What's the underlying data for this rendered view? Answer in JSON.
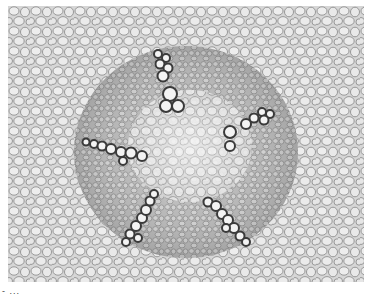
{
  "image": {
    "subject": "plant root cross-section micrograph",
    "description": "Grayscale light micrograph showing parenchyma cells surrounding a central stele with five radiating xylem arms",
    "colors": {
      "background": "#d8d8d8",
      "cell_fill": "#e6e6e6",
      "cell_wall": "#8a8a8a",
      "stele_shade": "#a8a8a8",
      "xylem_wall": "#2a2a2a",
      "xylem_fill": "#f2f2f2"
    },
    "xylem_arms": 5
  },
  "caption": {
    "text": "- ..."
  }
}
